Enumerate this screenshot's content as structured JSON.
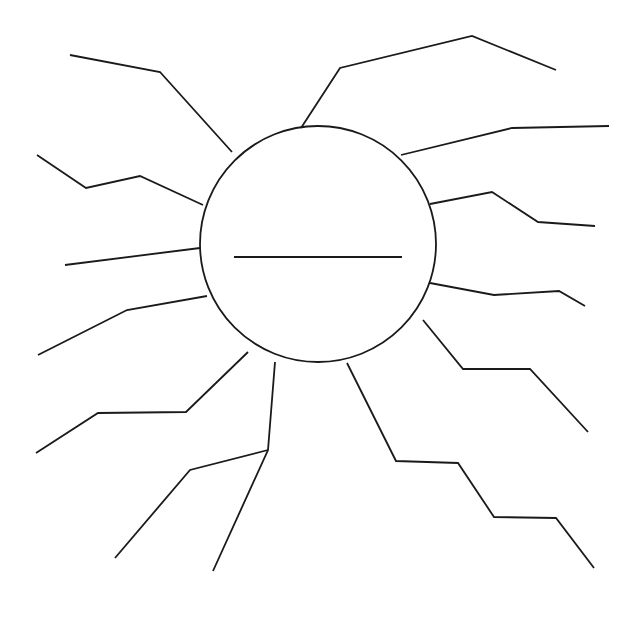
{
  "figure": {
    "canvas": {
      "width": 635,
      "height": 623,
      "background": "#ffffff"
    },
    "stroke": {
      "color": "#1a1a1a",
      "width": 1.8
    }
  },
  "hub": {
    "name": "central-circle",
    "center_x": 318,
    "center_y": 244,
    "radius": 118,
    "stroke_width": 1.8,
    "inner_line": {
      "name": "hub-horizontal-line",
      "x1": 234,
      "y1": 257,
      "x2": 402,
      "y2": 257,
      "stroke_width": 2.2
    }
  },
  "rays": [
    {
      "id": "ray-nw-upper",
      "label": "Upper north-west ray",
      "points": "232,152 160,72 70,55"
    },
    {
      "id": "ray-n",
      "label": "North ray",
      "points": "301,128 340,68 472,36 556,70"
    },
    {
      "id": "ray-ne",
      "label": "North-east ray",
      "points": "401,155 512,128 609,126"
    },
    {
      "id": "ray-e-upper",
      "label": "Upper east ray",
      "points": "430,204 492,192 538,222 595,226"
    },
    {
      "id": "ray-e-lower",
      "label": "Lower east ray",
      "points": "430,283 494,295 559,291 585,306"
    },
    {
      "id": "ray-se-upper",
      "label": "Upper south-east ray",
      "points": "423,320 463,369 530,369 588,432"
    },
    {
      "id": "ray-se-lower",
      "label": "Lower south-east ray",
      "points": "347,363 396,461 458,463 494,517 556,518 594,568"
    },
    {
      "id": "ray-s",
      "label": "South vertical ray",
      "points": "275,362 268,450 213,571"
    },
    {
      "id": "ray-sw-lower",
      "label": "Lower south-west ray",
      "points": "268,450 190,470 115,558"
    },
    {
      "id": "ray-sw-upper",
      "label": "Upper south-west ray",
      "points": "248,352 186,412 98,413 36,453"
    },
    {
      "id": "ray-w-lower",
      "label": "Lower west ray",
      "points": "207,296 127,310 38,355"
    },
    {
      "id": "ray-w",
      "label": "West horizontal ray",
      "points": "200,248 65,265"
    },
    {
      "id": "ray-w-upper",
      "label": "Upper west ray",
      "points": "203,205 140,176 86,188 37,155"
    }
  ]
}
